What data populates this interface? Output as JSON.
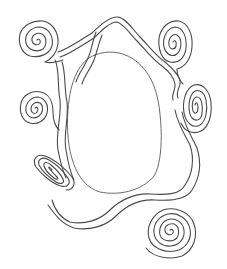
{
  "artwork": {
    "subject": "line-art frame with spirals surrounding an oval",
    "stroke_color": "#4a4a4a",
    "background_color": "#ffffff",
    "elements": [
      {
        "name": "center-oval",
        "cx": 110,
        "cy": 122,
        "rx": 45,
        "ry": 72
      },
      {
        "name": "spiral-top-left",
        "cx": 37,
        "cy": 40
      },
      {
        "name": "spiral-top-right",
        "cx": 173,
        "cy": 42
      },
      {
        "name": "spiral-mid-left",
        "cx": 35,
        "cy": 108
      },
      {
        "name": "spiral-mid-right",
        "cx": 195,
        "cy": 105
      },
      {
        "name": "spiral-bottom-left",
        "cx": 52,
        "cy": 170
      },
      {
        "name": "spiral-bottom-right",
        "cx": 170,
        "cy": 230
      }
    ]
  }
}
